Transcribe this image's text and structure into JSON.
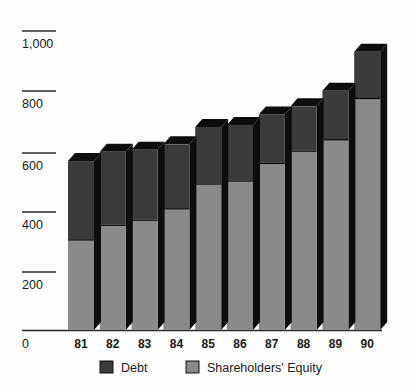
{
  "chart_data": {
    "type": "bar",
    "subtype": "stacked-3d-column",
    "title": "",
    "subtitle": "",
    "xlabel": "",
    "ylabel": "",
    "categories": [
      "81",
      "82",
      "83",
      "84",
      "85",
      "86",
      "87",
      "88",
      "89",
      "90"
    ],
    "series": [
      {
        "name": "Shareholders' Equity",
        "color": "#8a8a8a",
        "values": [
          303,
          352,
          369,
          407,
          490,
          500,
          559,
          600,
          638,
          776
        ]
      },
      {
        "name": "Debt",
        "color": "#3b3b3b",
        "values": [
          262,
          244,
          234,
          214,
          189,
          186,
          162,
          148,
          162,
          155
        ]
      }
    ],
    "totals": [
      565,
      596,
      603,
      621,
      679,
      686,
      721,
      748,
      800,
      931
    ],
    "ylim": [
      0,
      1000
    ],
    "yticks": [
      0,
      200,
      400,
      600,
      800,
      1000
    ],
    "ytick_labels": [
      "0",
      "200",
      "400",
      "600",
      "800",
      "1,000"
    ],
    "grid": false,
    "legend_position": "bottom"
  },
  "legend": {
    "items": [
      {
        "label": "Debt",
        "swatch": "#3b3b3b"
      },
      {
        "label": "Shareholders' Equity",
        "swatch": "#8a8a8a"
      }
    ]
  },
  "axis": {
    "y_labels": [
      "1,000",
      "800",
      "600",
      "400",
      "200",
      "0"
    ],
    "x_labels": [
      "81",
      "82",
      "83",
      "84",
      "85",
      "86",
      "87",
      "88",
      "89",
      "90"
    ]
  },
  "colors": {
    "background": "#fdfdfd",
    "equity": "#8a8a8a",
    "debt": "#3b3b3b",
    "three_d_shadow": "#0d0d0d",
    "axis": "#2b2b2b",
    "text": "#1a1a1a"
  }
}
